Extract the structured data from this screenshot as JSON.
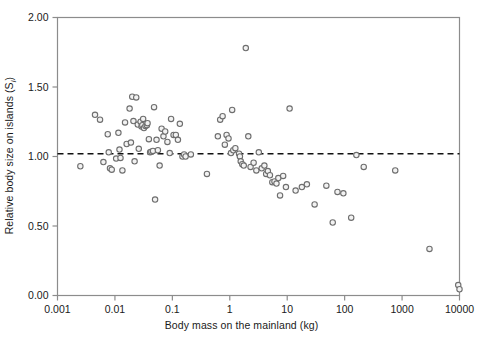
{
  "chart_data": {
    "type": "scatter",
    "title": "",
    "xlabel": "Body mass on the mainland (kg)",
    "ylabel_prefix": "Relative body size on islands (S",
    "ylabel_sub": "i",
    "ylabel_suffix": ")",
    "xscale": "log",
    "yscale": "linear",
    "xlim": [
      0.001,
      10000
    ],
    "ylim": [
      0.0,
      2.0
    ],
    "xticks": [
      0.001,
      0.01,
      0.1,
      1,
      10,
      100,
      1000,
      10000
    ],
    "xticklabels": [
      "0.001",
      "0.01",
      "0.1",
      "1",
      "10",
      "100",
      "1000",
      "10000"
    ],
    "yticks": [
      0.0,
      0.5,
      1.0,
      1.5,
      2.0
    ],
    "yticklabels": [
      "0.00",
      "0.50",
      "1.00",
      "1.50",
      "2.00"
    ],
    "grid": false,
    "legend": false,
    "marker": {
      "shape": "circle-open",
      "edge_color": "#6e6e6e",
      "face_color": "#f2f2f2",
      "size_px": 5.4
    },
    "reference_line": {
      "label": "S = 1.02",
      "y": 1.02,
      "style": "dashed",
      "color": "#111111",
      "width": 1.6
    },
    "axis_color": "#8c8c8c",
    "frame": "box",
    "n_points": 100,
    "series": [
      {
        "name": "Island mammal species",
        "points": [
          [
            0.0025,
            0.93
          ],
          [
            0.0045,
            1.3
          ],
          [
            0.0055,
            1.265
          ],
          [
            0.0063,
            0.96
          ],
          [
            0.0075,
            1.16
          ],
          [
            0.0078,
            1.03
          ],
          [
            0.0082,
            0.915
          ],
          [
            0.0088,
            0.905
          ],
          [
            0.0105,
            0.985
          ],
          [
            0.0115,
            1.17
          ],
          [
            0.012,
            1.05
          ],
          [
            0.0125,
            0.99
          ],
          [
            0.0135,
            0.9
          ],
          [
            0.015,
            1.245
          ],
          [
            0.016,
            1.09
          ],
          [
            0.018,
            1.345
          ],
          [
            0.019,
            1.1
          ],
          [
            0.02,
            1.43
          ],
          [
            0.021,
            1.255
          ],
          [
            0.022,
            0.965
          ],
          [
            0.0235,
            1.425
          ],
          [
            0.025,
            1.23
          ],
          [
            0.026,
            1.055
          ],
          [
            0.028,
            1.25
          ],
          [
            0.029,
            1.215
          ],
          [
            0.03,
            1.225
          ],
          [
            0.031,
            1.27
          ],
          [
            0.032,
            1.205
          ],
          [
            0.034,
            1.22
          ],
          [
            0.036,
            1.225
          ],
          [
            0.037,
            1.24
          ],
          [
            0.039,
            1.125
          ],
          [
            0.041,
            1.03
          ],
          [
            0.043,
            1.035
          ],
          [
            0.046,
            1.04
          ],
          [
            0.048,
            1.355
          ],
          [
            0.05,
            0.69
          ],
          [
            0.053,
            1.12
          ],
          [
            0.056,
            1.045
          ],
          [
            0.06,
            0.935
          ],
          [
            0.065,
            1.2
          ],
          [
            0.07,
            1.145
          ],
          [
            0.075,
            1.18
          ],
          [
            0.082,
            1.105
          ],
          [
            0.09,
            1.025
          ],
          [
            0.095,
            1.27
          ],
          [
            0.105,
            1.155
          ],
          [
            0.115,
            1.155
          ],
          [
            0.125,
            1.12
          ],
          [
            0.135,
            1.235
          ],
          [
            0.15,
            1.0
          ],
          [
            0.16,
            1.015
          ],
          [
            0.17,
            1.0
          ],
          [
            0.21,
            1.015
          ],
          [
            0.4,
            0.875
          ],
          [
            0.62,
            1.145
          ],
          [
            0.68,
            1.265
          ],
          [
            0.75,
            1.29
          ],
          [
            0.82,
            1.085
          ],
          [
            0.88,
            1.155
          ],
          [
            0.95,
            1.13
          ],
          [
            1.05,
            1.025
          ],
          [
            1.1,
            1.335
          ],
          [
            1.15,
            1.045
          ],
          [
            1.25,
            1.06
          ],
          [
            1.45,
            1.02
          ],
          [
            1.5,
            1.0
          ],
          [
            1.55,
            0.965
          ],
          [
            1.65,
            0.945
          ],
          [
            1.75,
            0.935
          ],
          [
            1.9,
            1.78
          ],
          [
            2.1,
            1.145
          ],
          [
            2.3,
            0.925
          ],
          [
            2.6,
            0.955
          ],
          [
            2.9,
            0.9
          ],
          [
            3.2,
            1.03
          ],
          [
            3.6,
            0.915
          ],
          [
            4.0,
            0.935
          ],
          [
            4.3,
            0.875
          ],
          [
            4.6,
            0.895
          ],
          [
            5.0,
            0.865
          ],
          [
            5.5,
            0.815
          ],
          [
            6.0,
            0.82
          ],
          [
            6.5,
            0.805
          ],
          [
            7.0,
            0.845
          ],
          [
            7.5,
            0.72
          ],
          [
            8.5,
            0.86
          ],
          [
            9.5,
            0.78
          ],
          [
            11.0,
            1.345
          ],
          [
            14.0,
            0.755
          ],
          [
            18.0,
            0.78
          ],
          [
            22.0,
            0.8
          ],
          [
            30.0,
            0.655
          ],
          [
            48.0,
            0.79
          ],
          [
            62.0,
            0.525
          ],
          [
            75.0,
            0.745
          ],
          [
            95.0,
            0.735
          ],
          [
            130.0,
            0.56
          ],
          [
            160.0,
            1.01
          ],
          [
            215.0,
            0.925
          ],
          [
            760.0,
            0.9
          ],
          [
            3000.0,
            0.335
          ],
          [
            9500.0,
            0.075
          ],
          [
            10000.0,
            0.045
          ]
        ]
      }
    ]
  }
}
